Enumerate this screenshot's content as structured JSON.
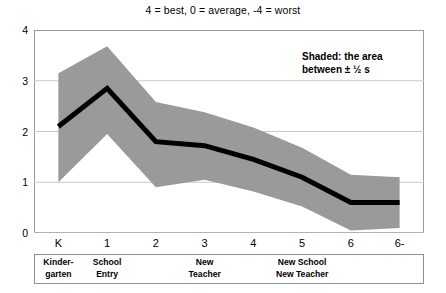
{
  "chart_data": {
    "type": "line",
    "title": "4 = best, 0 = average, -4 = worst",
    "xlabel": "",
    "ylabel": "",
    "ylim": [
      0,
      4
    ],
    "yticks": [
      4,
      3,
      2,
      1,
      0
    ],
    "grid": true,
    "legend": "none",
    "annotation_line1": "Shaded: the area",
    "annotation_line2": "between ±  ½ s",
    "categories": [
      "K",
      "1",
      "2",
      "3",
      "4",
      "5",
      "6",
      "6-end"
    ],
    "series": [
      {
        "name": "mean",
        "values": [
          2.1,
          2.85,
          1.8,
          1.72,
          1.45,
          1.1,
          0.6,
          0.6
        ]
      },
      {
        "name": "upper (+½ s)",
        "values": [
          3.15,
          3.68,
          2.58,
          2.38,
          2.08,
          1.68,
          1.15,
          1.1
        ]
      },
      {
        "name": "lower (-½ s)",
        "values": [
          1.0,
          1.95,
          0.9,
          1.05,
          0.82,
          0.52,
          0.05,
          0.1
        ]
      }
    ],
    "band_color": "#9a9a9a",
    "line_color": "#000000",
    "grid_color": "#c9c9c9",
    "frame_color": "#9b9b9b"
  },
  "phase_bands": [
    {
      "label": "Kinder-\ngarten",
      "category": "K"
    },
    {
      "label": "School\nEntry",
      "category": "1"
    },
    {
      "label": "New\nTeacher",
      "category": "3"
    },
    {
      "label": "New School\nNew Teacher",
      "category": "5"
    }
  ]
}
